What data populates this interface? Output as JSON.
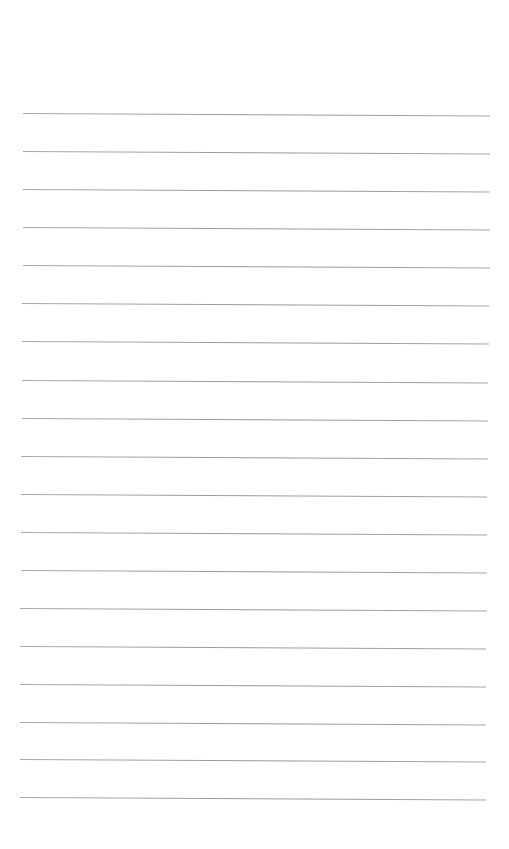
{
  "page": {
    "type": "ruled-paper",
    "background_color": "#ffffff",
    "rule_color": "#9e9e9e",
    "rule_count": 19,
    "rules": [
      {
        "y": 113,
        "x1": 23,
        "x2": 490,
        "tilt_deg": 0.3
      },
      {
        "y": 151,
        "x1": 23,
        "x2": 490,
        "tilt_deg": 0.3
      },
      {
        "y": 189,
        "x1": 23,
        "x2": 490,
        "tilt_deg": 0.3
      },
      {
        "y": 227,
        "x1": 23,
        "x2": 490,
        "tilt_deg": 0.3
      },
      {
        "y": 265,
        "x1": 23,
        "x2": 490,
        "tilt_deg": 0.3
      },
      {
        "y": 303,
        "x1": 22,
        "x2": 489,
        "tilt_deg": 0.3
      },
      {
        "y": 341,
        "x1": 22,
        "x2": 489,
        "tilt_deg": 0.3
      },
      {
        "y": 380,
        "x1": 22,
        "x2": 488,
        "tilt_deg": 0.3
      },
      {
        "y": 418,
        "x1": 22,
        "x2": 488,
        "tilt_deg": 0.3
      },
      {
        "y": 456,
        "x1": 21,
        "x2": 488,
        "tilt_deg": 0.3
      },
      {
        "y": 494,
        "x1": 21,
        "x2": 487,
        "tilt_deg": 0.3
      },
      {
        "y": 532,
        "x1": 21,
        "x2": 487,
        "tilt_deg": 0.3
      },
      {
        "y": 570,
        "x1": 21,
        "x2": 487,
        "tilt_deg": 0.3
      },
      {
        "y": 608,
        "x1": 20,
        "x2": 487,
        "tilt_deg": 0.3
      },
      {
        "y": 646,
        "x1": 20,
        "x2": 486,
        "tilt_deg": 0.3
      },
      {
        "y": 684,
        "x1": 20,
        "x2": 486,
        "tilt_deg": 0.3
      },
      {
        "y": 722,
        "x1": 20,
        "x2": 486,
        "tilt_deg": 0.3
      },
      {
        "y": 759,
        "x1": 20,
        "x2": 486,
        "tilt_deg": 0.3
      },
      {
        "y": 797,
        "x1": 20,
        "x2": 486,
        "tilt_deg": 0.3
      }
    ],
    "text_content": []
  }
}
